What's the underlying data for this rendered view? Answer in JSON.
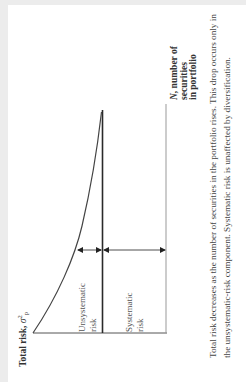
{
  "figure": {
    "orientation": "rotated-90-ccw",
    "y_axis_label": "Total risk,",
    "y_axis_symbol": "σ",
    "y_axis_symbol_sup": "2",
    "y_axis_symbol_sub": "P",
    "x_axis_label_var": "N",
    "x_axis_label_rest": ", number of\nsecurities\nin portfolio",
    "regions": {
      "unsystematic": "Unsystematic\nrisk",
      "systematic": "Systematic\nrisk"
    },
    "caption": "Total risk decreases as the number of securities in the portfolio rises. This drop occurs only in the unsystematic-risk component. Systematic risk is unaffected by diversification."
  },
  "colors": {
    "background": "#ececec",
    "page": "#ffffff",
    "line_dark": "#2a2a2a",
    "line_light": "#888888",
    "text": "#333333"
  }
}
